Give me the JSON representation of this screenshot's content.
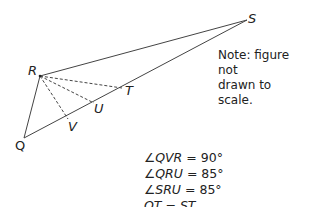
{
  "figure": {
    "points": {
      "R": {
        "label": "R",
        "x": 40,
        "y": 76
      },
      "S": {
        "label": "S",
        "x": 247,
        "y": 20
      },
      "Q": {
        "label": "Q",
        "x": 24,
        "y": 138
      },
      "T": {
        "label": "T",
        "x": 122,
        "y": 88
      },
      "U": {
        "label": "U",
        "x": 94,
        "y": 103
      },
      "V": {
        "label": "V",
        "x": 68,
        "y": 119
      }
    },
    "solid_segments": [
      "RS",
      "RQ",
      "QS"
    ],
    "dashed_segments": [
      "RT",
      "RU",
      "RV"
    ],
    "line_color": "#444444"
  },
  "note": {
    "line1": "Note: figure not",
    "line2": "drawn to scale."
  },
  "givens": [
    {
      "lhs": "∠QVR",
      "rhs": "90°"
    },
    {
      "lhs": "∠QRU",
      "rhs": "85°"
    },
    {
      "lhs": "∠SRU",
      "rhs": "85°"
    },
    {
      "lhs": "QT",
      "rhs": "ST"
    }
  ],
  "equals_sign": "="
}
